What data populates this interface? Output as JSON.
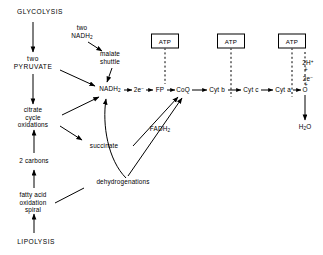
{
  "diagram": {
    "ink_color": "#000000",
    "background": "#ffffff"
  },
  "nodes": {
    "glycolysis": {
      "label": "GLYCOLYSIS",
      "x": 40,
      "y": 12
    },
    "two_nadh2": {
      "label": "two\nNADH",
      "sub": "2",
      "x": 82,
      "y": 33
    },
    "malate_shuttle": {
      "label": "malate\nshuttle",
      "x": 110,
      "y": 58
    },
    "two_pyruvate": {
      "label": "two\nPYRUVATE",
      "x": 33,
      "y": 63
    },
    "citrate_cycle": {
      "label": "citrate\ncycle\noxidations",
      "x": 33,
      "y": 117
    },
    "two_carbons": {
      "label": "2 carbons",
      "x": 34,
      "y": 161
    },
    "fatty_acid": {
      "label": "fatty acid\noxidation\nspiral",
      "x": 33,
      "y": 202
    },
    "lipolysis": {
      "label": "LIPOLYSIS",
      "x": 36,
      "y": 242
    },
    "nadh2": {
      "label": "NADH",
      "sub": "2",
      "x": 110,
      "y": 90
    },
    "two_electrons": {
      "label": "2e",
      "sup": "−",
      "x": 139,
      "y": 90
    },
    "fp": {
      "label": "FP",
      "x": 160,
      "y": 90
    },
    "coq": {
      "label": "CoQ",
      "x": 183,
      "y": 90
    },
    "cyt_b": {
      "label": "Cyt b",
      "x": 217,
      "y": 90
    },
    "cyt_c": {
      "label": "Cyt c",
      "x": 251,
      "y": 90
    },
    "cyt_a": {
      "label": "Cyt a",
      "x": 283,
      "y": 90
    },
    "oxygen": {
      "label": "O",
      "x": 305,
      "y": 90
    },
    "water": {
      "label": "H",
      "sub": "2",
      "label_tail": "O",
      "x": 305,
      "y": 128
    },
    "succinate": {
      "label": "succinate",
      "x": 104,
      "y": 146
    },
    "dehydrogenations": {
      "label": "dehydrogenations",
      "x": 123,
      "y": 182
    },
    "fadh2": {
      "label": "FADH",
      "sub": "2",
      "x": 160,
      "y": 130
    },
    "two_h_plus": {
      "label": "2H",
      "sup": "+",
      "x": 307,
      "y": 62
    },
    "plus_upper": {
      "label": "+",
      "x": 307,
      "y": 70
    },
    "two_e_minus": {
      "label": "2e",
      "sup": "−",
      "x": 307,
      "y": 78
    },
    "plus_lower": {
      "label": "+",
      "x": 307,
      "y": 85
    }
  },
  "atp_boxes": [
    {
      "label": "ATP",
      "x": 165,
      "y": 41
    },
    {
      "label": "ATP",
      "x": 231,
      "y": 41
    },
    {
      "label": "ATP",
      "x": 292,
      "y": 41
    }
  ]
}
